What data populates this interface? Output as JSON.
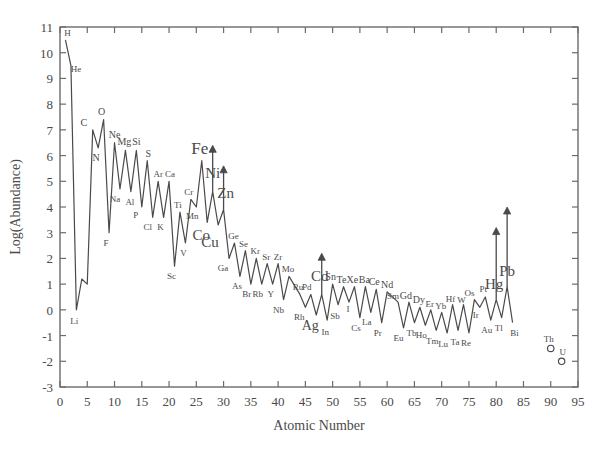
{
  "chart_data": {
    "type": "line",
    "title": "",
    "xlabel": "Atomic Number",
    "ylabel": "Log(Abundance)",
    "xlim": [
      0,
      95
    ],
    "ylim": [
      -3,
      11
    ],
    "xticks": [
      0,
      5,
      10,
      15,
      20,
      25,
      30,
      35,
      40,
      45,
      50,
      55,
      60,
      65,
      70,
      75,
      80,
      85,
      90,
      95
    ],
    "yticks": [
      -3,
      -2,
      -1,
      0,
      1,
      2,
      3,
      4,
      5,
      6,
      7,
      8,
      9,
      10,
      11
    ],
    "grid": false,
    "legend": null,
    "series": [
      {
        "name": "Solar system abundance",
        "x": [
          1,
          2,
          3,
          4,
          5,
          6,
          7,
          8,
          9,
          10,
          11,
          12,
          13,
          14,
          15,
          16,
          17,
          18,
          19,
          20,
          21,
          22,
          23,
          24,
          25,
          26,
          27,
          28,
          29,
          30,
          31,
          32,
          33,
          34,
          35,
          36,
          37,
          38,
          39,
          40,
          41,
          42,
          44,
          45,
          46,
          47,
          48,
          49,
          50,
          51,
          52,
          53,
          54,
          55,
          56,
          57,
          58,
          59,
          60,
          62,
          63,
          64,
          65,
          66,
          67,
          68,
          69,
          70,
          71,
          72,
          73,
          74,
          75,
          76,
          77,
          78,
          79,
          80,
          81,
          82,
          83
        ],
        "y": [
          10.5,
          9.5,
          0.0,
          1.2,
          1.0,
          7.0,
          6.3,
          7.4,
          3.0,
          6.5,
          4.7,
          6.2,
          4.6,
          6.2,
          4.0,
          5.8,
          3.6,
          5.0,
          3.6,
          5.0,
          1.7,
          3.8,
          2.6,
          4.3,
          4.0,
          5.8,
          3.4,
          4.6,
          3.3,
          3.9,
          2.0,
          2.6,
          1.3,
          2.3,
          1.0,
          2.0,
          1.0,
          1.8,
          1.0,
          1.8,
          0.4,
          1.3,
          0.6,
          0.1,
          0.6,
          -0.2,
          0.6,
          -0.4,
          1.0,
          0.2,
          0.9,
          0.3,
          0.9,
          -0.3,
          0.9,
          -0.1,
          0.8,
          -0.5,
          0.7,
          0.3,
          -0.7,
          0.3,
          -0.5,
          0.1,
          -0.6,
          0.0,
          -0.8,
          -0.1,
          -0.9,
          0.2,
          -0.8,
          0.2,
          -0.9,
          0.4,
          0.1,
          0.5,
          -0.4,
          0.4,
          -0.3,
          0.9,
          -0.5
        ]
      }
    ],
    "isolated_points": [
      {
        "label": "Th",
        "x": 90,
        "y": -1.5
      },
      {
        "label": "U",
        "x": 92,
        "y": -2.0
      }
    ],
    "point_labels": [
      {
        "label": "H",
        "x": 1,
        "y": 10.5,
        "size": 9,
        "dx": 2,
        "dy": -4
      },
      {
        "label": "He",
        "x": 2,
        "y": 9.5,
        "size": 9,
        "dx": 5,
        "dy": 6
      },
      {
        "label": "Li",
        "x": 3,
        "y": 0.0,
        "size": 9,
        "dx": -2,
        "dy": 14
      },
      {
        "label": "C",
        "x": 6,
        "y": 7.0,
        "size": 10,
        "dx": -9,
        "dy": -4
      },
      {
        "label": "N",
        "x": 7,
        "y": 6.3,
        "size": 10,
        "dx": -2,
        "dy": 13
      },
      {
        "label": "O",
        "x": 8,
        "y": 7.4,
        "size": 10,
        "dx": -2,
        "dy": -5
      },
      {
        "label": "F",
        "x": 9,
        "y": 3.0,
        "size": 9,
        "dx": -3,
        "dy": 13
      },
      {
        "label": "Ne",
        "x": 10,
        "y": 6.5,
        "size": 10,
        "dx": 0,
        "dy": -5
      },
      {
        "label": "Na",
        "x": 11,
        "y": 4.7,
        "size": 9,
        "dx": -5,
        "dy": 13
      },
      {
        "label": "Mg",
        "x": 12,
        "y": 6.2,
        "size": 10,
        "dx": -1,
        "dy": -5
      },
      {
        "label": "Al",
        "x": 13,
        "y": 4.6,
        "size": 9,
        "dx": -1,
        "dy": 13
      },
      {
        "label": "Si",
        "x": 14,
        "y": 6.2,
        "size": 10,
        "dx": 0,
        "dy": -5
      },
      {
        "label": "P",
        "x": 15,
        "y": 4.0,
        "size": 9,
        "dx": -6,
        "dy": 11
      },
      {
        "label": "S",
        "x": 16,
        "y": 5.8,
        "size": 10,
        "dx": 1,
        "dy": -4
      },
      {
        "label": "Cl",
        "x": 17,
        "y": 3.6,
        "size": 9,
        "dx": -5,
        "dy": 13
      },
      {
        "label": "Ar",
        "x": 18,
        "y": 5.0,
        "size": 9,
        "dx": 0,
        "dy": -4
      },
      {
        "label": "K",
        "x": 19,
        "y": 3.6,
        "size": 9,
        "dx": -3,
        "dy": 13
      },
      {
        "label": "Ca",
        "x": 20,
        "y": 5.0,
        "size": 9,
        "dx": 1,
        "dy": -4
      },
      {
        "label": "Sc",
        "x": 21,
        "y": 1.7,
        "size": 9,
        "dx": -3,
        "dy": 13
      },
      {
        "label": "Ti",
        "x": 22,
        "y": 3.8,
        "size": 9,
        "dx": -2,
        "dy": -4
      },
      {
        "label": "V",
        "x": 23,
        "y": 2.6,
        "size": 9,
        "dx": -2,
        "dy": 13
      },
      {
        "label": "Cr",
        "x": 24,
        "y": 4.3,
        "size": 9,
        "dx": -2,
        "dy": -4
      },
      {
        "label": "Mn",
        "x": 25,
        "y": 4.0,
        "size": 9,
        "dx": -4,
        "dy": 12
      },
      {
        "label": "Fe",
        "x": 26,
        "y": 5.8,
        "size": 17,
        "dx": -2,
        "dy": -7
      },
      {
        "label": "Co",
        "x": 27,
        "y": 3.4,
        "size": 15,
        "dx": -6,
        "dy": 18
      },
      {
        "label": "Ni",
        "x": 28,
        "y": 4.6,
        "size": 15,
        "dx": 0,
        "dy": -14
      },
      {
        "label": "Cu",
        "x": 29,
        "y": 3.3,
        "size": 15,
        "dx": -8,
        "dy": 22
      },
      {
        "label": "Zn",
        "x": 30,
        "y": 3.9,
        "size": 15,
        "dx": 2,
        "dy": -12
      },
      {
        "label": "Ga",
        "x": 31,
        "y": 2.0,
        "size": 9,
        "dx": -6,
        "dy": 13
      },
      {
        "label": "Ge",
        "x": 32,
        "y": 2.6,
        "size": 9,
        "dx": -1,
        "dy": -4
      },
      {
        "label": "As",
        "x": 33,
        "y": 1.3,
        "size": 9,
        "dx": -3,
        "dy": 13
      },
      {
        "label": "Se",
        "x": 34,
        "y": 2.3,
        "size": 9,
        "dx": -2,
        "dy": -4
      },
      {
        "label": "Br",
        "x": 35,
        "y": 1.0,
        "size": 9,
        "dx": -4,
        "dy": 13
      },
      {
        "label": "Kr",
        "x": 36,
        "y": 2.0,
        "size": 9,
        "dx": -1,
        "dy": -4
      },
      {
        "label": "Rb",
        "x": 37,
        "y": 1.0,
        "size": 9,
        "dx": -4,
        "dy": 13
      },
      {
        "label": "Sr",
        "x": 38,
        "y": 1.8,
        "size": 9,
        "dx": -1,
        "dy": -4
      },
      {
        "label": "Y",
        "x": 39,
        "y": 1.0,
        "size": 9,
        "dx": -2,
        "dy": 13
      },
      {
        "label": "Zr",
        "x": 40,
        "y": 1.8,
        "size": 9,
        "dx": 0,
        "dy": -4
      },
      {
        "label": "Nb",
        "x": 41,
        "y": 0.4,
        "size": 9,
        "dx": -5,
        "dy": 13
      },
      {
        "label": "Mo",
        "x": 42,
        "y": 1.3,
        "size": 9,
        "dx": -1,
        "dy": -4
      },
      {
        "label": "Ru",
        "x": 44,
        "y": 0.6,
        "size": 9,
        "dx": -2,
        "dy": -4
      },
      {
        "label": "Rh",
        "x": 45,
        "y": 0.1,
        "size": 9,
        "dx": -6,
        "dy": 13
      },
      {
        "label": "Pd",
        "x": 46,
        "y": 0.6,
        "size": 9,
        "dx": -4,
        "dy": -4
      },
      {
        "label": "Ag",
        "x": 47,
        "y": -0.2,
        "size": 14,
        "dx": -6,
        "dy": 15
      },
      {
        "label": "Cd",
        "x": 48,
        "y": 0.6,
        "size": 15,
        "dx": -2,
        "dy": -13
      },
      {
        "label": "In",
        "x": 49,
        "y": -0.4,
        "size": 9,
        "dx": -2,
        "dy": 15
      },
      {
        "label": "Sn",
        "x": 50,
        "y": 1.0,
        "size": 10,
        "dx": -2,
        "dy": -4
      },
      {
        "label": "Sb",
        "x": 51,
        "y": 0.2,
        "size": 9,
        "dx": -3,
        "dy": 14
      },
      {
        "label": "Te",
        "x": 52,
        "y": 0.9,
        "size": 10,
        "dx": -2,
        "dy": -4
      },
      {
        "label": "I",
        "x": 53,
        "y": 0.3,
        "size": 9,
        "dx": -1,
        "dy": 10
      },
      {
        "label": "Xe",
        "x": 54,
        "y": 0.9,
        "size": 10,
        "dx": -2,
        "dy": -4
      },
      {
        "label": "Cs",
        "x": 55,
        "y": -0.3,
        "size": 9,
        "dx": -4,
        "dy": 13
      },
      {
        "label": "Ba",
        "x": 56,
        "y": 0.9,
        "size": 10,
        "dx": -1,
        "dy": -4
      },
      {
        "label": "La",
        "x": 57,
        "y": -0.1,
        "size": 9,
        "dx": -4,
        "dy": 13
      },
      {
        "label": "Ce",
        "x": 58,
        "y": 0.8,
        "size": 10,
        "dx": -2,
        "dy": -4
      },
      {
        "label": "Pr",
        "x": 59,
        "y": -0.5,
        "size": 9,
        "dx": -4,
        "dy": 13
      },
      {
        "label": "Nd",
        "x": 60,
        "y": 0.7,
        "size": 10,
        "dx": 0,
        "dy": -4
      },
      {
        "label": "Sm",
        "x": 62,
        "y": 0.3,
        "size": 9,
        "dx": -5,
        "dy": -3
      },
      {
        "label": "Eu",
        "x": 63,
        "y": -0.7,
        "size": 9,
        "dx": -5,
        "dy": 13
      },
      {
        "label": "Gd",
        "x": 64,
        "y": 0.3,
        "size": 10,
        "dx": -3,
        "dy": -3
      },
      {
        "label": "Tb",
        "x": 65,
        "y": -0.5,
        "size": 9,
        "dx": -3,
        "dy": 13
      },
      {
        "label": "Dy",
        "x": 66,
        "y": 0.1,
        "size": 10,
        "dx": -1,
        "dy": -4
      },
      {
        "label": "Ho",
        "x": 67,
        "y": -0.6,
        "size": 9,
        "dx": -4,
        "dy": 13
      },
      {
        "label": "Er",
        "x": 68,
        "y": 0.0,
        "size": 9,
        "dx": -1,
        "dy": -3
      },
      {
        "label": "Tm",
        "x": 69,
        "y": -0.8,
        "size": 9,
        "dx": -4,
        "dy": 14
      },
      {
        "label": "Yb",
        "x": 70,
        "y": -0.1,
        "size": 9,
        "dx": -1,
        "dy": -3
      },
      {
        "label": "Lu",
        "x": 71,
        "y": -0.9,
        "size": 9,
        "dx": -4,
        "dy": 14
      },
      {
        "label": "Hf",
        "x": 72,
        "y": 0.2,
        "size": 9,
        "dx": -2,
        "dy": -3
      },
      {
        "label": "Ta",
        "x": 73,
        "y": -0.8,
        "size": 9,
        "dx": -3,
        "dy": 15
      },
      {
        "label": "W",
        "x": 74,
        "y": 0.2,
        "size": 9,
        "dx": -2,
        "dy": -2
      },
      {
        "label": "Re",
        "x": 75,
        "y": -0.9,
        "size": 9,
        "dx": -3,
        "dy": 13
      },
      {
        "label": "Os",
        "x": 76,
        "y": 0.4,
        "size": 9,
        "dx": -5,
        "dy": -4
      },
      {
        "label": "Ir",
        "x": 77,
        "y": 0.1,
        "size": 9,
        "dx": -4,
        "dy": 11
      },
      {
        "label": "Pt",
        "x": 78,
        "y": 0.5,
        "size": 9,
        "dx": -2,
        "dy": -5
      },
      {
        "label": "Au",
        "x": 79,
        "y": -0.4,
        "size": 9,
        "dx": -4,
        "dy": 13
      },
      {
        "label": "Hg",
        "x": 80,
        "y": 0.4,
        "size": 15,
        "dx": -2,
        "dy": -11
      },
      {
        "label": "Tl",
        "x": 81,
        "y": -0.3,
        "size": 9,
        "dx": -3,
        "dy": 13
      },
      {
        "label": "Pb",
        "x": 82,
        "y": 0.9,
        "size": 15,
        "dx": 0,
        "dy": -11
      },
      {
        "label": "Bi",
        "x": 83,
        "y": -0.5,
        "size": 9,
        "dx": 2,
        "dy": 13
      },
      {
        "label": "Th",
        "x": 90,
        "y": -1.5,
        "size": 9,
        "dx": -2,
        "dy": -6
      },
      {
        "label": "U",
        "x": 92,
        "y": -2.0,
        "size": 9,
        "dx": 1,
        "dy": -6
      }
    ],
    "upper_limit_arrows": [
      {
        "element": "Ni",
        "x": 28,
        "y_from": 4.6,
        "y_to": 6.4
      },
      {
        "element": "Zn",
        "x": 30,
        "y_from": 3.9,
        "y_to": 5.6
      },
      {
        "element": "Cd",
        "x": 48,
        "y_from": 0.6,
        "y_to": 2.2
      },
      {
        "element": "Hg",
        "x": 80,
        "y_from": 0.4,
        "y_to": 3.2
      },
      {
        "element": "Pb",
        "x": 82,
        "y_from": 0.9,
        "y_to": 4.0
      }
    ],
    "colors": {
      "line": "#4a4a4a",
      "axis": "#6b6b6b",
      "text": "#4a4a4a",
      "background": "#ffffff"
    }
  }
}
